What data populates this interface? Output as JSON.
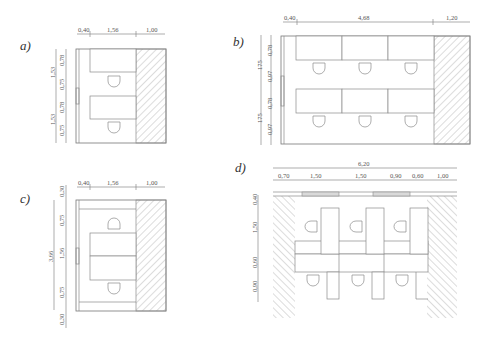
{
  "panels": {
    "a": {
      "label": "a)",
      "top_dims": [
        "0,40",
        "1,56",
        "1,00"
      ],
      "left_outer_dims": [
        "1,53",
        "1,53"
      ],
      "left_inner_dims": [
        "0,78",
        "0,75",
        "0,78",
        "0,75"
      ]
    },
    "b": {
      "label": "b)",
      "top_dims": [
        "0,40",
        "4,68",
        "1,20"
      ],
      "left_outer_dims": [
        "175",
        "175"
      ],
      "left_inner_dims": [
        "0,78",
        "0,97",
        "0,78",
        "0,97"
      ]
    },
    "c": {
      "label": "c)",
      "top_dims": [
        "0,40",
        "1,56",
        "1,00"
      ],
      "left_outer_dims": [
        "3,66"
      ],
      "left_inner_dims": [
        "0,30",
        "0,75",
        "1,56",
        "0,75",
        "0,30"
      ]
    },
    "d": {
      "label": "d)",
      "total_dim": "6,20",
      "top_dims": [
        "0,70",
        "1,50",
        "1,50",
        "0,90",
        "0,60",
        "1,00"
      ],
      "left_dims": [
        "0,40",
        "1,50",
        "0,60",
        "0,90"
      ]
    }
  },
  "colors": {
    "line": "#8a8a8a",
    "text": "#555555",
    "window_fill": "#d9d9d9",
    "background": "#ffffff"
  }
}
